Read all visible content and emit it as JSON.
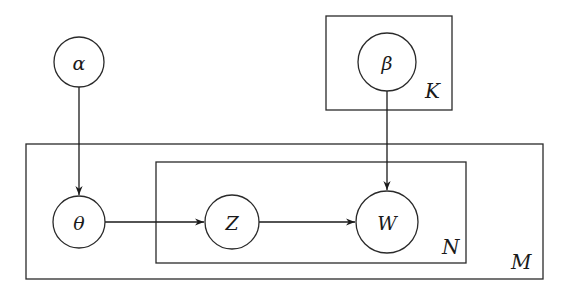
{
  "diagram": {
    "title": "",
    "type": "plate-notation",
    "nodes": [
      {
        "id": "alpha",
        "label": "α"
      },
      {
        "id": "beta",
        "label": "β"
      },
      {
        "id": "theta",
        "label": "θ"
      },
      {
        "id": "z",
        "label": "Z"
      },
      {
        "id": "w",
        "label": "W"
      }
    ],
    "plates": [
      {
        "id": "K",
        "label": "K",
        "contains": [
          "beta"
        ]
      },
      {
        "id": "M",
        "label": "M",
        "contains": [
          "theta",
          "z",
          "w"
        ]
      },
      {
        "id": "N",
        "label": "N",
        "contains": [
          "z",
          "w"
        ]
      }
    ],
    "edges": [
      {
        "from": "alpha",
        "to": "theta"
      },
      {
        "from": "theta",
        "to": "z"
      },
      {
        "from": "z",
        "to": "w"
      },
      {
        "from": "beta",
        "to": "w"
      }
    ],
    "colors": {
      "stroke": "#2a2a2a",
      "background": "#ffffff"
    }
  }
}
